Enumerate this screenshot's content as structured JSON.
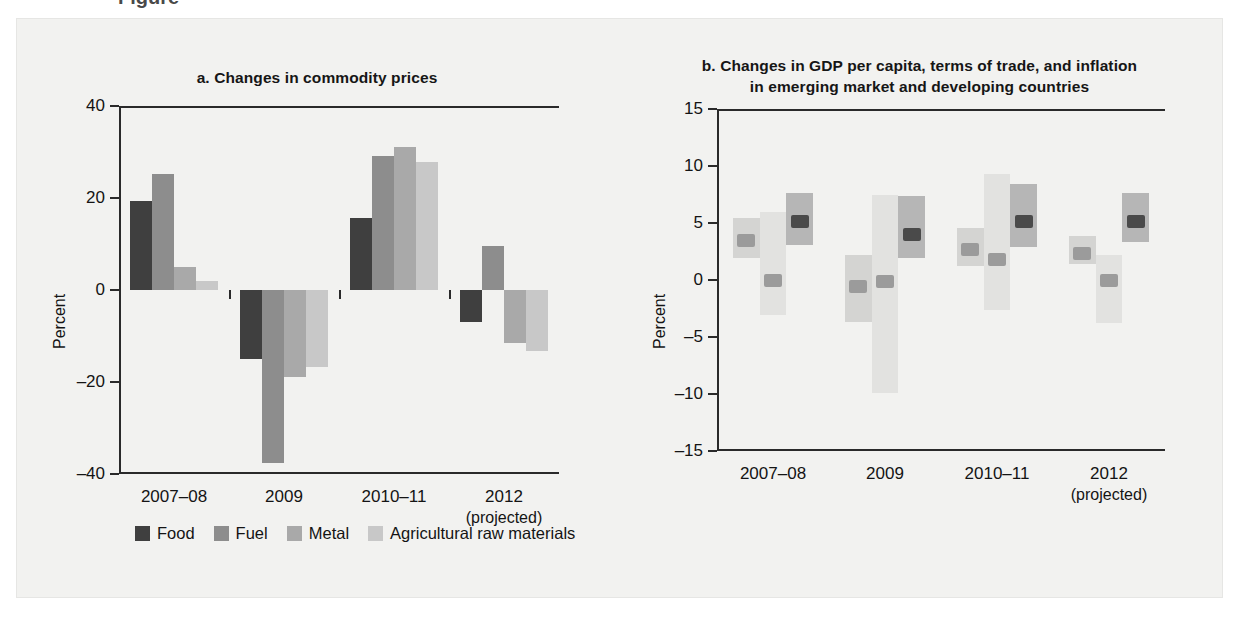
{
  "figure": {
    "background": "#f2f2f0",
    "top_cut_caption": "Figure"
  },
  "chart_data": [
    {
      "id": "a",
      "type": "bar",
      "title": "a.  Changes in commodity prices",
      "ylabel": "Percent",
      "xlabel": "",
      "ylim": [
        -40,
        40
      ],
      "yticks": [
        40,
        20,
        0,
        -20,
        -40
      ],
      "ytick_labels": [
        "40",
        "20",
        "0",
        "–20",
        "–40"
      ],
      "grid": false,
      "legend_position": "bottom-left",
      "categories": [
        "2007–08",
        "2009",
        "2010–11",
        "2012"
      ],
      "category_sublabels": [
        "",
        "",
        "",
        "(projected)"
      ],
      "series": [
        {
          "name": "Food",
          "color": "#3f3f3f",
          "values": [
            19.3,
            -15.0,
            15.6,
            -7.0
          ]
        },
        {
          "name": "Fuel",
          "color": "#8d8d8d",
          "values": [
            25.2,
            -37.5,
            29.1,
            9.5
          ]
        },
        {
          "name": "Metal",
          "color": "#a9a9a9",
          "values": [
            5.0,
            -19.0,
            31.0,
            -11.5
          ]
        },
        {
          "name": "Agricultural raw materials",
          "color": "#c8c8c8",
          "values": [
            2.0,
            -16.8,
            27.9,
            -13.2
          ]
        }
      ]
    },
    {
      "id": "b",
      "type": "floating-bar",
      "title_line1": "b.  Changes in GDP per capita, terms of trade, and inflation",
      "title_line2": "in emerging market and developing countries",
      "ylabel": "Percent",
      "xlabel": "",
      "ylim": [
        -15,
        15
      ],
      "yticks": [
        15,
        10,
        5,
        0,
        -5,
        -10,
        -15
      ],
      "ytick_labels": [
        "15",
        "10",
        "5",
        "0",
        "–5",
        "–10",
        "–15"
      ],
      "grid": false,
      "legend_position": "bottom",
      "categories": [
        "2007–08",
        "2009",
        "2010–11",
        "2012"
      ],
      "category_sublabels": [
        "",
        "",
        "",
        "(projected)"
      ],
      "ranges": [
        {
          "name": "Real GDP per capita",
          "color": "#d4d4d2",
          "median_name": "Median, real GDP per capita",
          "median_color": "#9b9b9b",
          "low": [
            1.9,
            -3.7,
            1.2,
            1.4
          ],
          "high": [
            5.4,
            2.2,
            4.6,
            3.9
          ],
          "median": [
            3.5,
            -0.6,
            2.7,
            2.3
          ]
        },
        {
          "name": "Terms of trade",
          "color": "#e2e2e0",
          "median_name": "Median, terms of trade",
          "median_color": "#9b9b9b",
          "low": [
            -3.1,
            -9.9,
            -2.6,
            -3.8
          ],
          "high": [
            6.0,
            7.5,
            9.3,
            2.2
          ],
          "median": [
            0.0,
            -0.1,
            1.8,
            0.0
          ]
        },
        {
          "name": "Inflation",
          "color": "#b6b6b6",
          "median_name": "Median, inflation",
          "median_color": "#4a4a4a",
          "low": [
            3.1,
            1.9,
            2.9,
            3.3
          ],
          "high": [
            7.6,
            7.4,
            8.4,
            7.6
          ],
          "median": [
            5.1,
            4.0,
            5.1,
            5.1
          ]
        }
      ]
    }
  ],
  "legend_a": {
    "items": [
      {
        "label": "Food",
        "color": "#3f3f3f"
      },
      {
        "label": "Fuel",
        "color": "#8d8d8d"
      },
      {
        "label": "Metal",
        "color": "#a9a9a9"
      },
      {
        "label": "Agricultural raw materials",
        "color": "#c8c8c8"
      }
    ]
  },
  "legend_b": {
    "left_items": [
      {
        "label": "Real GDP per capita",
        "color": "#d4d4d2"
      },
      {
        "label": "Median, real GDP per capita",
        "color": "#9b9b9b"
      },
      {
        "label": "Terms of trade",
        "color": "#e2e2e0"
      }
    ],
    "right_items": [
      {
        "label": "Median, terms of trade",
        "color": "#9b9b9b"
      },
      {
        "label": "Inflation",
        "color": "#cfcfcd"
      },
      {
        "label": "Median, inflation",
        "color": "#4a4a4a"
      }
    ]
  }
}
